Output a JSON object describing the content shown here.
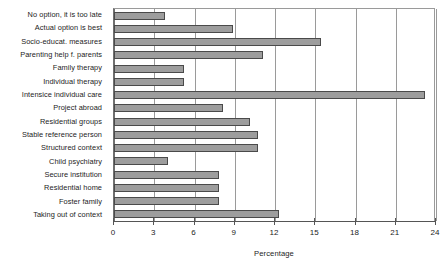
{
  "chart_data": {
    "type": "bar",
    "orientation": "horizontal",
    "title": "",
    "xlabel": "Percentage",
    "ylabel": "",
    "xlim": [
      0,
      24
    ],
    "xticks": [
      0,
      3,
      6,
      9,
      12,
      15,
      18,
      21,
      24
    ],
    "grid": "vertical",
    "legend": "none",
    "bar_color": "#9d9d9d",
    "bar_border_color": "#4a4a4a",
    "categories": [
      "No option, it is too late",
      "Actual option is best",
      "Socio-educat. measures",
      "Parenting help f. parents",
      "Family therapy",
      "Individual therapy",
      "Intensice individual care",
      "Project abroad",
      "Residential groups",
      "Stable reference person",
      "Structured context",
      "Child psychiatry",
      "Secure institution",
      "Residential home",
      "Foster family",
      "Taking out of context"
    ],
    "values": [
      3.8,
      8.9,
      15.4,
      11.1,
      5.2,
      5.2,
      23.2,
      8.1,
      10.1,
      10.7,
      10.7,
      4.0,
      7.8,
      7.8,
      7.8,
      12.3
    ]
  }
}
